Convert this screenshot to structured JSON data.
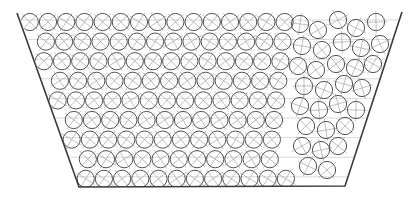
{
  "diagram": {
    "title": "Circular particles packed in a trapezoidal hopper",
    "canvas": {
      "width": 415,
      "height": 198
    },
    "colors": {
      "background": "#ffffff",
      "wall": "#3a3a3a",
      "particle_outline": "#4a4a4a",
      "particle_mark": "#8a8a8a",
      "grid_line": "#9a9a9a"
    },
    "container": {
      "shape": "trapezoid",
      "top_left": [
        17,
        13
      ],
      "top_right": [
        402,
        12
      ],
      "bottom_right": [
        345,
        186
      ],
      "bottom_left": [
        79,
        187
      ],
      "open_top": true
    },
    "particles": {
      "radius": 8.6,
      "ordered_region": {
        "x_spacing": 18.2,
        "row_spacing": 19.6,
        "first_row_y": 22,
        "rows": 9,
        "stagger": 9.1,
        "x_max": 292
      },
      "disordered_region": {
        "x_min": 292,
        "centers": [
          [
            300,
            24
          ],
          [
            318,
            30
          ],
          [
            338,
            20
          ],
          [
            356,
            28
          ],
          [
            376,
            22
          ],
          [
            392,
            26
          ],
          [
            302,
            46
          ],
          [
            322,
            50
          ],
          [
            342,
            42
          ],
          [
            361,
            48
          ],
          [
            380,
            44
          ],
          [
            298,
            66
          ],
          [
            316,
            70
          ],
          [
            336,
            64
          ],
          [
            355,
            68
          ],
          [
            373,
            64
          ],
          [
            304,
            86
          ],
          [
            324,
            90
          ],
          [
            344,
            84
          ],
          [
            362,
            88
          ],
          [
            300,
            106
          ],
          [
            319,
            110
          ],
          [
            338,
            104
          ],
          [
            356,
            110
          ],
          [
            306,
            126
          ],
          [
            326,
            130
          ],
          [
            345,
            126
          ],
          [
            302,
            146
          ],
          [
            321,
            150
          ],
          [
            338,
            146
          ],
          [
            308,
            166
          ],
          [
            327,
            170
          ]
        ]
      },
      "mark": "cross"
    },
    "grid": {
      "horizontal_line_spacing": 19.6,
      "visible": true
    }
  }
}
